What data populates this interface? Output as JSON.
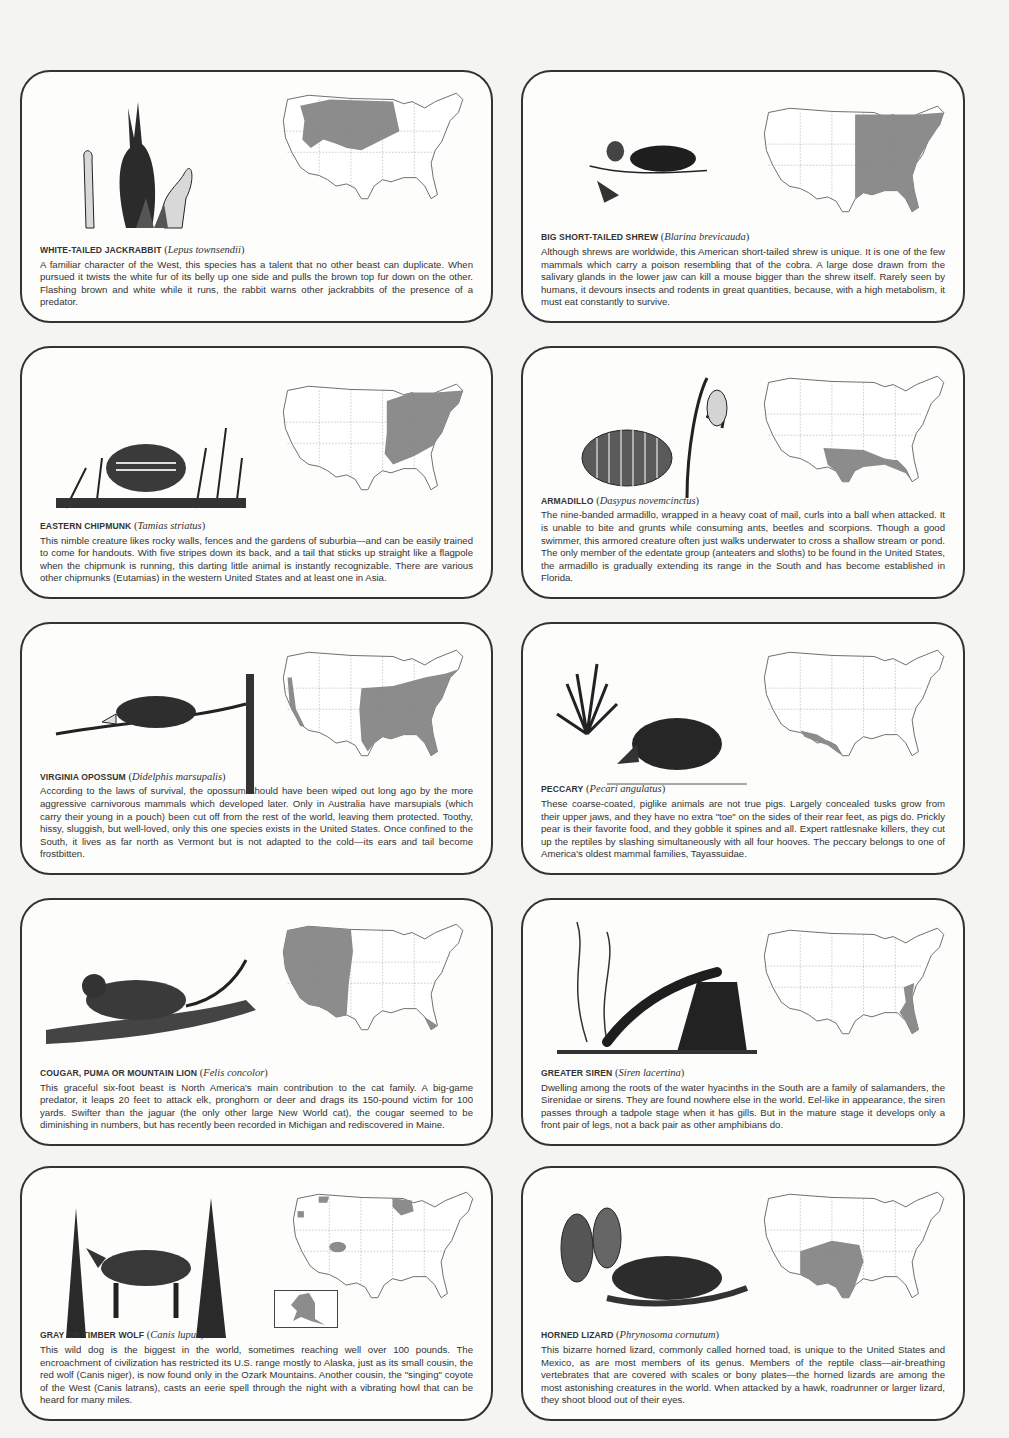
{
  "colors": {
    "range_fill": "#8c8c8c",
    "border": "#333333",
    "paper": "#f4f4f2"
  },
  "cards": [
    {
      "common_name": "WHITE-TAILED JACKRABBIT",
      "latin_name": "Lepus townsendii",
      "illustration": "jackrabbit-with-prickly-pear-cactus",
      "range": "northern plains and intermountain west",
      "body": "A familiar character of the West, this species has a talent that no other beast can duplicate. When pursued it twists the white fur of its belly up one side and pulls the brown top fur down on the other. Flashing brown and white while it runs, the rabbit warns other jackrabbits of the presence of a predator."
    },
    {
      "common_name": "BIG SHORT-TAILED SHREW",
      "latin_name": "Blarina brevicauda",
      "illustration": "shrew-with-acorn-and-leaves",
      "range": "eastern half of the United States",
      "body": "Although shrews are worldwide, this American short-tailed shrew is unique. It is one of the few mammals which carry a poison resembling that of the cobra. A large dose drawn from the salivary glands in the lower jaw can kill a mouse bigger than the shrew itself. Rarely seen by humans, it devours insects and rodents in great quantities, because, with a high metabolism, it must eat constantly to survive."
    },
    {
      "common_name": "EASTERN CHIPMUNK",
      "latin_name": "Tamias striatus",
      "illustration": "chipmunk-in-grass",
      "range": "eastern United States",
      "body": "This nimble creature likes rocky walls, fences and the gardens of suburbia—and can be easily trained to come for handouts. With five stripes down its back, and a tail that sticks up straight like a flagpole when the chipmunk is running, this darting little animal is instantly recognizable. There are various other chipmunks (Eutamias) in the western United States and at least one in Asia."
    },
    {
      "common_name": "ARMADILLO",
      "latin_name": "Dasypus novemcinctus",
      "illustration": "armadillo-with-cactus",
      "range": "Texas, Gulf coast and Florida",
      "body": "The nine-banded armadillo, wrapped in a heavy coat of mail, curls into a ball when attacked. It is unable to bite and grunts while consuming ants, beetles and scorpions. Though a good swimmer, this armored creature often just walks underwater to cross a shallow stream or pond. The only member of the edentate group (anteaters and sloths) to be found in the United States, the armadillo is gradually extending its range in the South and has become established in Florida."
    },
    {
      "common_name": "VIRGINIA OPOSSUM",
      "latin_name": "Didelphis marsupalis",
      "illustration": "opossum-on-branch",
      "range": "eastern and southern United States plus Pacific coast",
      "body": "According to the laws of survival, the opossum should have been wiped out long ago by the more aggressive carnivorous mammals which developed later. Only in Australia have marsupials (which carry their young in a pouch) been cut off from the rest of the world, leaving them protected. Toothy, hissy, sluggish, but well-loved, only this one species exists in the United States. Once confined to the South, it lives as far north as Vermont but is not adapted to the cold—its ears and tail become frostbitten."
    },
    {
      "common_name": "PECCARY",
      "latin_name": "Pecari angulatus",
      "illustration": "peccary-with-yucca",
      "range": "southern Texas, New Mexico and Arizona",
      "body": "These coarse-coated, piglike animals are not true pigs. Largely concealed tusks grow from their upper jaws, and they have no extra \"toe\" on the sides of their rear feet, as pigs do. Prickly pear is their favorite food, and they gobble it spines and all. Expert rattlesnake killers, they cut up the reptiles by slashing simultaneously with all four hooves. The peccary belongs to one of America's oldest mammal families, Tayassuidae."
    },
    {
      "common_name": "COUGAR, PUMA OR MOUNTAIN LION",
      "latin_name": "Felis concolor",
      "illustration": "cougar-on-branch",
      "range": "western United States and southern Florida",
      "body": "This graceful six-foot beast is North America's main contribution to the cat family. A big-game predator, it leaps 20 feet to attack elk, pronghorn or deer and drags its 150-pound victim for 100 yards. Swifter than the jaguar (the only other large New World cat), the cougar seemed to be diminishing in numbers, but has recently been recorded in Michigan and rediscovered in Maine."
    },
    {
      "common_name": "GREATER SIREN",
      "latin_name": "Siren lacertina",
      "illustration": "siren-on-rock-with-water-plants",
      "range": "southeastern coastal plain",
      "body": "Dwelling among the roots of the water hyacinths in the South are a family of salamanders, the Sirenidae or sirens. They are found nowhere else in the world. Eel-like in appearance, the siren passes through a tadpole stage when it has gills. But in the mature stage it develops only a front pair of legs, not a back pair as other amphibians do."
    },
    {
      "common_name": "GRAY OR TIMBER WOLF",
      "latin_name": "Canis lupus",
      "illustration": "wolf-among-pine-trees",
      "range": "Alaska, northern Minnesota and scattered pockets",
      "inset": "Alaska",
      "body": "This wild dog is the biggest in the world, sometimes reaching well over 100 pounds. The encroachment of civilization has restricted its U.S. range mostly to Alaska, just as its small cousin, the red wolf (Canis niger), is now found only in the Ozark Mountains. Another cousin, the \"singing\" coyote of the West (Canis latrans), casts an eerie spell through the night with a vibrating howl that can be heard for many miles."
    },
    {
      "common_name": "HORNED LIZARD",
      "latin_name": "Phrynosoma cornutum",
      "illustration": "horned-lizard-with-cacti",
      "range": "southern plains and southwest",
      "body": "This bizarre horned lizard, commonly called horned toad, is unique to the United States and Mexico, as are most members of its genus. Members of the reptile class—air-breathing vertebrates that are covered with scales or bony plates—the horned lizards are among the most astonishing creatures in the world. When attacked by a hawk, roadrunner or larger lizard, they shoot blood out of their eyes."
    }
  ]
}
